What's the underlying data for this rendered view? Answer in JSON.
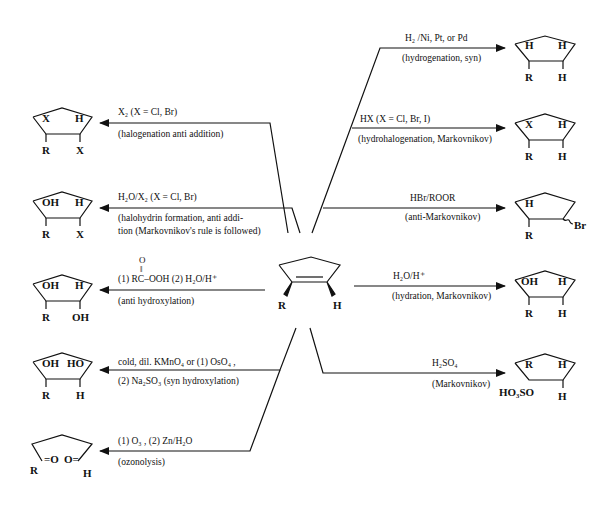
{
  "diagram": {
    "type": "reaction-scheme",
    "center": {
      "name": "substituted cyclopentene",
      "substituents": {
        "left": "R",
        "right": "H"
      }
    },
    "left_reactions": [
      {
        "reagent": "X₂ (X = Cl, Br)",
        "description": "(halogenation anti addition)",
        "product": {
          "top_left": "X",
          "top_right": "H",
          "bottom_left": "R",
          "bottom_right": "X"
        }
      },
      {
        "reagent": "H₂O/X₂   (X = Cl, Br)",
        "description": "(halohydrin formation, anti addi-",
        "description2": "tion (Markovnikov's rule is followed)",
        "product": {
          "top_left": "OH",
          "top_right": "H",
          "bottom_left": "R",
          "bottom_right": "X"
        }
      },
      {
        "reagent_top": "O",
        "reagent_mid": "‖",
        "reagent": "(1) RC–OOH (2) H₂O/H⁺",
        "description": "(anti hydroxylation)",
        "product": {
          "top_left": "OH",
          "top_right": "H",
          "bottom_left": "R",
          "bottom_right": "OH"
        }
      },
      {
        "reagent": "cold, dil. KMnO₄ or (1) OsO₄ ,",
        "description": "(2) Na₂SO₃ (syn hydroxylation)",
        "product": {
          "top_left": "OH",
          "top_right": "HO",
          "bottom_left": "R",
          "bottom_right": "H"
        }
      },
      {
        "reagent": "(1) O₃ , (2) Zn/H₂O",
        "description": "(ozonolysis)",
        "product": {
          "left_group": "R",
          "left_carbonyl": "=O",
          "right_carbonyl": "O=",
          "right_group": "H"
        }
      }
    ],
    "right_reactions": [
      {
        "reagent": "H₂ /Ni, Pt, or Pd",
        "description": "(hydrogenation, syn)",
        "product": {
          "top_left": "H",
          "top_right": "H",
          "bottom_left": "R",
          "bottom_right": "H"
        }
      },
      {
        "reagent": "HX (X = Cl, Br, I)",
        "description": "(hydrohalogenation, Markovnikov)",
        "product": {
          "top_left": "X",
          "top_right": "H",
          "bottom_left": "R",
          "bottom_right": "H"
        }
      },
      {
        "reagent": "HBr/ROOR",
        "description": "(anti-Markovnikov)",
        "product": {
          "top_left": "H",
          "bottom_left": "R",
          "right_sub": "Br"
        }
      },
      {
        "reagent": "H₂O/H⁺",
        "description": "(hydration, Markovnikov)",
        "product": {
          "top_left": "OH",
          "top_right": "H",
          "bottom_left": "R",
          "bottom_right": "H"
        }
      },
      {
        "reagent": "H₂SO₄",
        "description": "(Markovnikov)",
        "product": {
          "top_left": "R",
          "top_right": "H",
          "bottom_left": "HO₃SO",
          "bottom_right": "H"
        }
      }
    ]
  }
}
